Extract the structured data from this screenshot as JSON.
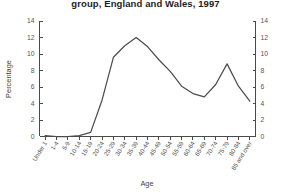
{
  "chart_data": {
    "type": "line",
    "title": "group, England and Wales, 1997",
    "xlabel": "Age",
    "ylabel": "Percentage",
    "ylim": [
      0,
      14
    ],
    "ytick_values": [
      0,
      2,
      4,
      6,
      8,
      10,
      12,
      14
    ],
    "ytick_labels": [
      "0",
      "2",
      "4",
      "6",
      "8",
      "10",
      "12",
      "14"
    ],
    "right_axis": {
      "label": "",
      "ylim": [
        0,
        14
      ],
      "ytick_labels": [
        "0",
        "2",
        "4",
        "6",
        "8",
        "10",
        "12",
        "14"
      ]
    },
    "grid": false,
    "legend": false,
    "categories": [
      "Under 1",
      "1-4",
      "5-9",
      "10-14",
      "15-19",
      "20-24",
      "25-29",
      "30-34",
      "35-39",
      "40-44",
      "45-49",
      "50-54",
      "55-59",
      "60-64",
      "65-69",
      "70-74",
      "75-79",
      "80-84",
      "85 and over"
    ],
    "values": [
      0.1,
      0.0,
      0.0,
      0.1,
      0.5,
      4.4,
      9.6,
      11.0,
      12.0,
      10.9,
      9.3,
      7.9,
      6.1,
      5.2,
      4.8,
      6.3,
      8.8,
      6.1,
      4.3
    ],
    "series": [
      {
        "name": "Percentage",
        "color": "#4d4d4d",
        "values": [
          0.1,
          0.0,
          0.0,
          0.1,
          0.5,
          4.4,
          9.6,
          11.0,
          12.0,
          10.9,
          9.3,
          7.9,
          6.1,
          5.2,
          4.8,
          6.3,
          8.8,
          6.1,
          4.3
        ]
      }
    ]
  }
}
